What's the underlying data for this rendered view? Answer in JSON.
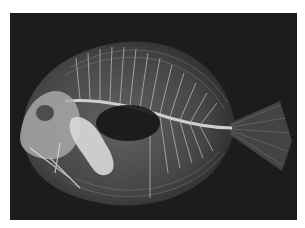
{
  "image": {
    "subject": "X-ray radiograph of a laterally compressed fish (surgeonfish-like), facing left",
    "background_color": "#1c1c1c",
    "border_color": "#ffffff"
  }
}
